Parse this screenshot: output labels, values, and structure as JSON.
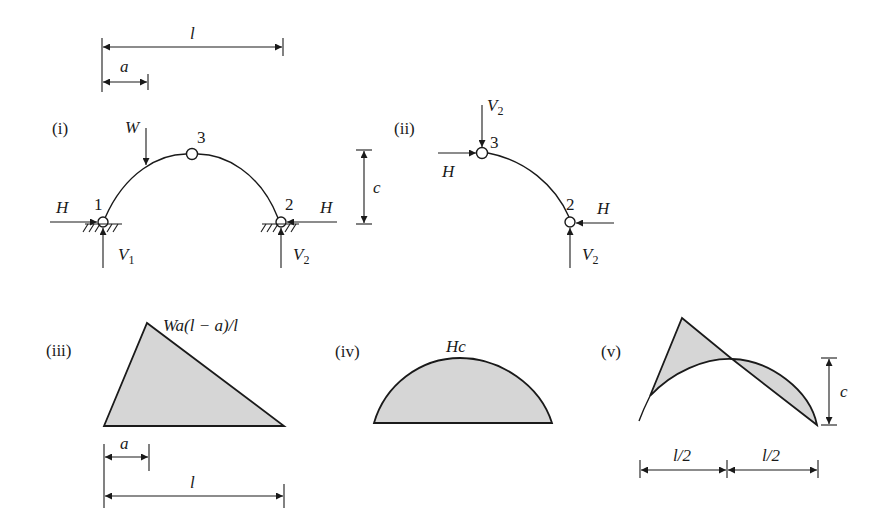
{
  "figure": {
    "panels": [
      {
        "id": "i",
        "label": "(i)",
        "description": "Three-hinged arch with point load W"
      },
      {
        "id": "ii",
        "label": "(ii)",
        "description": "Free body of right half of arch"
      },
      {
        "id": "iii",
        "label": "(iii)",
        "description": "Free bending moment diagram (triangle)"
      },
      {
        "id": "iv",
        "label": "(iv)",
        "description": "Reactant moment diagram Hc"
      },
      {
        "id": "v",
        "label": "(v)",
        "description": "Combined bending moment diagram"
      }
    ],
    "top_dims": {
      "span": "l",
      "load_pos": "a"
    },
    "panel_i": {
      "load": "W",
      "nodes": [
        "1",
        "2",
        "3"
      ],
      "H_left": "H",
      "H_right": "H",
      "V1": "V",
      "V1_sub": "1",
      "V2": "V",
      "V2_sub": "2",
      "rise": "c"
    },
    "panel_ii": {
      "V_top": "V",
      "V_top_sub": "2",
      "H_top": "H",
      "node_top": "3",
      "node_bottom": "2",
      "H_bottom": "H",
      "V_bottom": "V",
      "V_bottom_sub": "2"
    },
    "panel_iii": {
      "peak": "Wa(l − a)/l",
      "dim_a": "a",
      "dim_l": "l"
    },
    "panel_iv": {
      "peak": "Hc"
    },
    "panel_v": {
      "rise": "c",
      "dim_left": "l/2",
      "dim_right": "l/2"
    }
  }
}
